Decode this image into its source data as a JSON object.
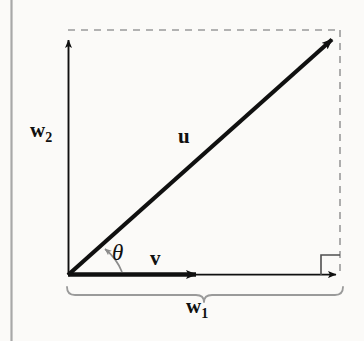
{
  "figure": {
    "kind": "vector-decomposition-diagram",
    "background_color": "#fbfaf8",
    "ink_color": "#101010",
    "guide_color": "#9a9a9a",
    "margin_rule_color": "#a8a8a8"
  },
  "labels": {
    "u": "u",
    "v": "v",
    "theta": "θ",
    "w1_base": "w",
    "w1_sub": "1",
    "w2_base": "w",
    "w2_sub": "2"
  },
  "geometry": {
    "origin_x": 68,
    "origin_y": 275,
    "tip_x": 341,
    "tip_y": 32,
    "v_arrow_end_x": 205,
    "axis_end_x": 340,
    "axis_top_y": 38,
    "dashed_top_y": 30,
    "dashed_right_x": 340,
    "brace_left_x": 66,
    "brace_right_x": 343,
    "brace_y": 287,
    "margin_rule_x": 11
  },
  "elements": [
    {
      "name": "vector-u",
      "type": "arrow",
      "style": "solid-thick"
    },
    {
      "name": "vector-v",
      "type": "arrow",
      "style": "solid-thick"
    },
    {
      "name": "x-axis",
      "type": "arrow",
      "style": "solid-thin"
    },
    {
      "name": "y-axis",
      "type": "arrow",
      "style": "solid-thin"
    },
    {
      "name": "guide-top",
      "type": "line",
      "style": "dashed"
    },
    {
      "name": "guide-right",
      "type": "line",
      "style": "dashed"
    },
    {
      "name": "right-angle-marker",
      "type": "square"
    },
    {
      "name": "angle-arc",
      "type": "arc-arrow"
    },
    {
      "name": "brace-w1",
      "type": "brace"
    }
  ]
}
